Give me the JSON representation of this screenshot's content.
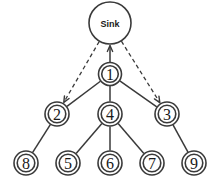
{
  "diagram": {
    "canvas": {
      "width": 218,
      "height": 185,
      "background": "#ffffff"
    },
    "stroke_color": "#3a3a3a",
    "fill_color": "#ffffff",
    "nodes": [
      {
        "id": "sink",
        "label": "Sink",
        "cx": 110,
        "cy": 23,
        "r": 21,
        "shape": "circle",
        "level": 0
      },
      {
        "id": "n1",
        "label": "①",
        "text": "1",
        "cx": 110,
        "cy": 74,
        "r": 11.5,
        "shape": "double-circle",
        "level": 1
      },
      {
        "id": "n2",
        "label": "②",
        "text": "2",
        "cx": 57,
        "cy": 114,
        "r": 12,
        "shape": "double-circle",
        "level": 2
      },
      {
        "id": "n4",
        "label": "④",
        "text": "4",
        "cx": 110,
        "cy": 114,
        "r": 12,
        "shape": "double-circle",
        "level": 2
      },
      {
        "id": "n3",
        "label": "③",
        "text": "3",
        "cx": 167,
        "cy": 114,
        "r": 12,
        "shape": "double-circle",
        "level": 2
      },
      {
        "id": "n8",
        "label": "⑧",
        "text": "8",
        "cx": 26,
        "cy": 163,
        "r": 12,
        "shape": "double-circle",
        "level": 3
      },
      {
        "id": "n5",
        "label": "⑤",
        "text": "5",
        "cx": 68,
        "cy": 163,
        "r": 12,
        "shape": "double-circle",
        "level": 3
      },
      {
        "id": "n6",
        "label": "⑥",
        "text": "6",
        "cx": 110,
        "cy": 163,
        "r": 12,
        "shape": "double-circle",
        "level": 3
      },
      {
        "id": "n7",
        "label": "⑦",
        "text": "7",
        "cx": 152,
        "cy": 163,
        "r": 12,
        "shape": "double-circle",
        "level": 3
      },
      {
        "id": "n9",
        "label": "⑨",
        "text": "9",
        "cx": 194,
        "cy": 163,
        "r": 12,
        "shape": "double-circle",
        "level": 3
      }
    ],
    "edges": [
      {
        "id": "e-n1-sink",
        "from": "n1",
        "to": "sink",
        "style": "solid",
        "arrow": "to"
      },
      {
        "id": "e-sink-n2",
        "from": "sink",
        "to": "n2",
        "style": "dashed",
        "arrow": "to"
      },
      {
        "id": "e-sink-n3",
        "from": "sink",
        "to": "n3",
        "style": "dashed",
        "arrow": "to"
      },
      {
        "id": "e-n1-n2",
        "from": "n1",
        "to": "n2",
        "style": "solid",
        "arrow": "none"
      },
      {
        "id": "e-n1-n4",
        "from": "n1",
        "to": "n4",
        "style": "solid",
        "arrow": "none"
      },
      {
        "id": "e-n1-n3",
        "from": "n1",
        "to": "n3",
        "style": "solid",
        "arrow": "none"
      },
      {
        "id": "e-n2-n8",
        "from": "n2",
        "to": "n8",
        "style": "solid",
        "arrow": "none"
      },
      {
        "id": "e-n4-n5",
        "from": "n4",
        "to": "n5",
        "style": "solid",
        "arrow": "none"
      },
      {
        "id": "e-n4-n6",
        "from": "n4",
        "to": "n6",
        "style": "solid",
        "arrow": "none"
      },
      {
        "id": "e-n4-n7",
        "from": "n4",
        "to": "n7",
        "style": "solid",
        "arrow": "none"
      },
      {
        "id": "e-n3-n9",
        "from": "n3",
        "to": "n9",
        "style": "solid",
        "arrow": "none"
      }
    ]
  }
}
